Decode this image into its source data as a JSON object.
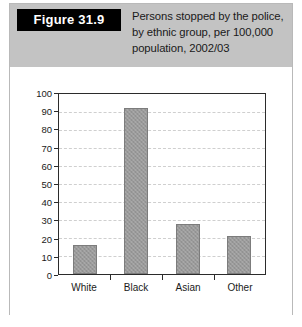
{
  "figure": {
    "tag": "Figure 31.9",
    "caption": "Persons stopped by the police, by ethnic group, per 100,000 population, 2002/03"
  },
  "chart_data": {
    "type": "bar",
    "title": "Persons stopped by the police, by ethnic group, per 100,000 population, 2002/03",
    "categories": [
      "White",
      "Black",
      "Asian",
      "Other"
    ],
    "values": [
      16,
      92,
      28,
      21
    ],
    "xlabel": "",
    "ylabel": "",
    "ylim": [
      0,
      100
    ],
    "yticks": [
      0,
      10,
      20,
      30,
      40,
      50,
      60,
      70,
      80,
      90,
      100
    ],
    "ytick_labels": [
      "0",
      "10",
      "20",
      "30",
      "40",
      "50",
      "60",
      "70",
      "80",
      "90",
      "100"
    ],
    "grid": true,
    "legend": false,
    "bar_color": "#9a9a9a",
    "axis_color": "#2b2b2b",
    "grid_color": "#cfcfcf"
  },
  "style": {
    "header_background": "#c3c3c3",
    "tag_background": "#000000",
    "tag_text_color": "#ffffff",
    "card_border": "#b9b9b9",
    "page_background": "#ffffff"
  }
}
